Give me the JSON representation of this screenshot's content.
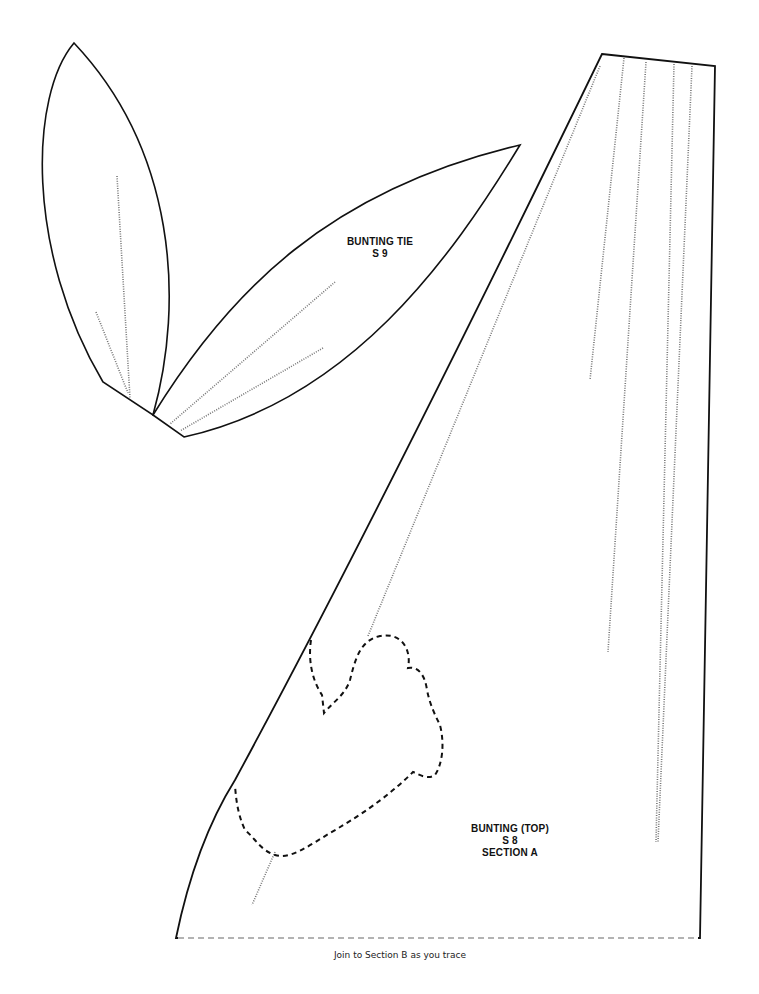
{
  "pattern_pieces": [
    {
      "id": "bunting-tie",
      "title": "BUNTING TIE",
      "code": "S 9"
    },
    {
      "id": "bunting-top",
      "title": "BUNTING (TOP)",
      "code": "S 8",
      "section": "SECTION A"
    }
  ],
  "footer": {
    "instruction": "Join to Section B as you trace"
  },
  "colors": {
    "outline": "#111111",
    "dotted_grainline": "#777777",
    "dashed_placement": "#111111",
    "join_line": "#9a9a9a",
    "background": "#ffffff"
  }
}
